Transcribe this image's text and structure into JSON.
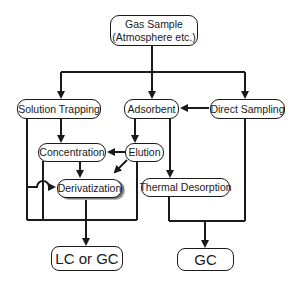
{
  "diagram": {
    "nodes": {
      "gas_sample_line1": "Gas Sample",
      "gas_sample_line2": "(Atmosphere etc.)",
      "solution_trapping": "Solution Trapping",
      "adsorbent": "Adsorbent",
      "direct_sampling": "Direct Sampling",
      "concentration": "Concentration",
      "elution": "Elution",
      "derivatization": "Derivatization",
      "thermal_desorption": "Thermal Desorption",
      "lc_or_gc": "LC or GC",
      "gc": "GC"
    },
    "edges": [
      [
        "Gas Sample",
        "Solution Trapping"
      ],
      [
        "Gas Sample",
        "Adsorbent"
      ],
      [
        "Gas Sample",
        "Direct Sampling"
      ],
      [
        "Direct Sampling",
        "Adsorbent"
      ],
      [
        "Solution Trapping",
        "Concentration"
      ],
      [
        "Adsorbent",
        "Elution"
      ],
      [
        "Elution",
        "Concentration"
      ],
      [
        "Elution",
        "Derivatization"
      ],
      [
        "Concentration",
        "Derivatization"
      ],
      [
        "Solution Trapping",
        "Derivatization"
      ],
      [
        "Adsorbent",
        "Thermal Desorption"
      ],
      [
        "Solution Trapping / Concentration / Elution / Derivatization",
        "LC or GC"
      ],
      [
        "Thermal Desorption / Direct Sampling",
        "GC"
      ]
    ],
    "colors": {
      "stroke": "#1a1a1a",
      "background": "#ffffff"
    }
  }
}
